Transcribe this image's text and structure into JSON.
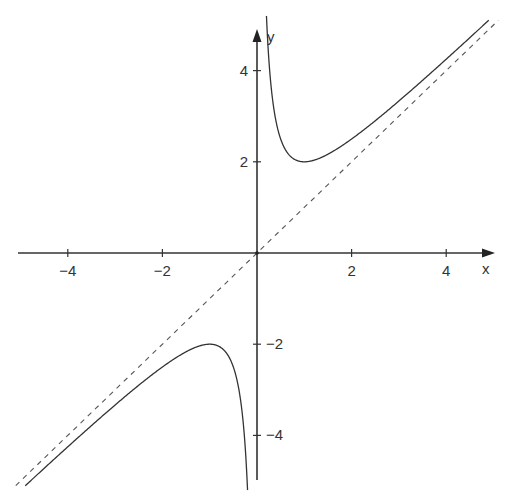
{
  "chart_data": {
    "type": "line",
    "title": "",
    "function": "f(x) = x + 1/x",
    "xlabel": "x",
    "ylabel": "y",
    "xlim": [
      -5,
      5
    ],
    "ylim": [
      -5,
      5
    ],
    "grid": false,
    "legend": null,
    "x_ticks": [
      -4,
      -2,
      2,
      4
    ],
    "x_tick_labels": [
      "−4",
      "−2",
      "2",
      "4"
    ],
    "y_ticks": [
      4,
      2,
      -2,
      -4
    ],
    "y_tick_labels": [
      "4",
      "2",
      "−2",
      "−4"
    ],
    "series": [
      {
        "name": "f(x) = x + 1/x (x > 0 branch)",
        "style": "solid",
        "color": "#333333",
        "x": [
          0.2,
          0.25,
          0.3,
          0.4,
          0.5,
          0.6,
          0.8,
          1.0,
          1.25,
          1.5,
          2.0,
          2.5,
          3.0,
          3.5,
          4.0,
          4.5,
          4.9
        ],
        "y": [
          5.2,
          4.25,
          3.63,
          2.9,
          2.5,
          2.27,
          2.05,
          2.0,
          2.05,
          2.17,
          2.5,
          2.9,
          3.33,
          3.79,
          4.25,
          4.72,
          5.1
        ]
      },
      {
        "name": "f(x) = x + 1/x (x < 0 branch)",
        "style": "solid",
        "color": "#333333",
        "x": [
          -4.9,
          -4.5,
          -4.0,
          -3.5,
          -3.0,
          -2.5,
          -2.0,
          -1.5,
          -1.25,
          -1.0,
          -0.8,
          -0.6,
          -0.5,
          -0.4,
          -0.3,
          -0.25,
          -0.2
        ],
        "y": [
          -5.1,
          -4.72,
          -4.25,
          -3.79,
          -3.33,
          -2.9,
          -2.5,
          -2.17,
          -2.05,
          -2.0,
          -2.05,
          -2.27,
          -2.5,
          -2.9,
          -3.63,
          -4.25,
          -5.2
        ]
      },
      {
        "name": "asymptote y = x",
        "style": "dashed",
        "color": "#555555",
        "x": [
          -5.1,
          5.1
        ],
        "y": [
          -5.1,
          5.1
        ]
      }
    ],
    "annotations": [
      {
        "label": "local minimum",
        "x": 1,
        "y": 2
      },
      {
        "label": "local maximum",
        "x": -1,
        "y": -2
      }
    ]
  },
  "axes": {
    "x_label": "x",
    "y_label": "y"
  }
}
